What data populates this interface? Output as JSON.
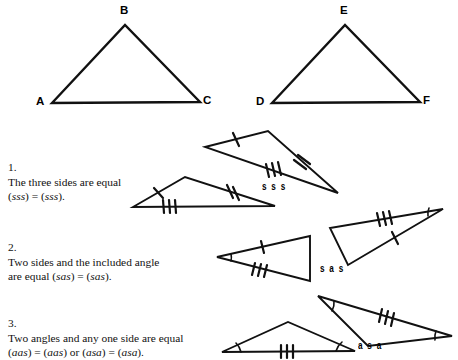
{
  "page": {
    "background_color": "#ffffff",
    "ink_color": "#111111",
    "width": 458,
    "height": 360
  },
  "reference_triangles": [
    {
      "name": "triangle-abc",
      "vertices": [
        {
          "label": "A",
          "x": 52,
          "y": 103,
          "label_x": 36,
          "label_y": 96
        },
        {
          "label": "B",
          "x": 125,
          "y": 25,
          "label_x": 120,
          "label_y": 5
        },
        {
          "label": "C",
          "x": 200,
          "y": 102,
          "label_x": 203,
          "label_y": 95
        }
      ]
    },
    {
      "name": "triangle-def",
      "vertices": [
        {
          "label": "D",
          "x": 272,
          "y": 103,
          "label_x": 256,
          "label_y": 96
        },
        {
          "label": "E",
          "x": 345,
          "y": 25,
          "label_x": 340,
          "label_y": 5
        },
        {
          "label": "F",
          "x": 420,
          "y": 102,
          "label_x": 423,
          "label_y": 95
        }
      ]
    }
  ],
  "rules": [
    {
      "id": "rule-sss",
      "number": "1.",
      "line1": "The three sides are equal",
      "line2_prefix": "(",
      "line2_sym1": "sss",
      "line2_mid": ") = (",
      "line2_sym2": "sss",
      "line2_suffix": ").",
      "criterion_label": "s s s",
      "criterion_label_x": 262,
      "criterion_label_y": 180,
      "text_x": 8,
      "text_y": 160
    },
    {
      "id": "rule-sas",
      "number": "2.",
      "line1": "Two sides and the included angle",
      "line2_prefix": "are equal (",
      "line2_sym1": "sas",
      "line2_mid": ") = (",
      "line2_sym2": "sas",
      "line2_suffix": ").",
      "criterion_label": "s a s",
      "criterion_label_x": 320,
      "criterion_label_y": 262,
      "text_x": 8,
      "text_y": 240
    },
    {
      "id": "rule-asa",
      "number": "3.",
      "line1": "Two angles and any one side are equal",
      "line2_prefix": "(",
      "line2_sym1": "aas",
      "line2_mid": ") = (",
      "line2_sym2": "aas",
      "line2_mid2": ") or (",
      "line2_sym3": "asa",
      "line2_mid3": ") = (",
      "line2_sym4": "asa",
      "line2_suffix": ").",
      "criterion_label": "a s a",
      "criterion_label_x": 358,
      "criterion_label_y": 339,
      "text_x": 8,
      "text_y": 316
    }
  ],
  "figure_groups": [
    {
      "id": "sss-pair",
      "triangles": [
        {
          "name": "sss-upper-triangle",
          "points": "205,147 268,131 338,193",
          "marks": [
            {
              "type": "ticks",
              "count": 1,
              "edge_from": [
                205,
                147
              ],
              "edge_to": [
                268,
                131
              ]
            },
            {
              "type": "ticks",
              "count": 2,
              "edge_from": [
                268,
                131
              ],
              "edge_to": [
                338,
                193
              ]
            },
            {
              "type": "ticks",
              "count": 3,
              "edge_from": [
                338,
                193
              ],
              "edge_to": [
                205,
                147
              ]
            }
          ]
        },
        {
          "name": "sss-lower-triangle",
          "points": "133,207 185,177 275,206",
          "marks": [
            {
              "type": "ticks",
              "count": 1,
              "edge_from": [
                133,
                207
              ],
              "edge_to": [
                185,
                177
              ]
            },
            {
              "type": "ticks",
              "count": 2,
              "edge_from": [
                185,
                177
              ],
              "edge_to": [
                275,
                206
              ]
            },
            {
              "type": "ticks",
              "count": 3,
              "edge_from": [
                275,
                206
              ],
              "edge_to": [
                133,
                207
              ]
            }
          ]
        }
      ]
    },
    {
      "id": "sas-pair",
      "triangles": [
        {
          "name": "sas-left-triangle",
          "points": "217,257 310,236 310,281",
          "marks": [
            {
              "type": "ticks",
              "count": 1,
              "edge_from": [
                217,
                257
              ],
              "edge_to": [
                310,
                236
              ]
            },
            {
              "type": "ticks",
              "count": 3,
              "edge_from": [
                310,
                281
              ],
              "edge_to": [
                217,
                257
              ]
            },
            {
              "type": "angle-arc",
              "vertex": [
                217,
                257
              ]
            }
          ]
        },
        {
          "name": "sas-right-triangle",
          "points": "443,209 330,228 348,265",
          "marks": [
            {
              "type": "ticks",
              "count": 3,
              "edge_from": [
                330,
                228
              ],
              "edge_to": [
                443,
                209
              ]
            },
            {
              "type": "ticks",
              "count": 1,
              "edge_from": [
                348,
                265
              ],
              "edge_to": [
                443,
                209
              ]
            },
            {
              "type": "angle-arc",
              "vertex": [
                443,
                209
              ]
            }
          ]
        }
      ]
    },
    {
      "id": "asa-pair",
      "triangles": [
        {
          "name": "asa-lower-triangle",
          "points": "222,352 288,322 355,351",
          "marks": [
            {
              "type": "ticks",
              "count": 3,
              "edge_from": [
                222,
                352
              ],
              "edge_to": [
                355,
                351
              ]
            },
            {
              "type": "angle-arc",
              "vertex": [
                222,
                352
              ]
            },
            {
              "type": "angle-arc",
              "vertex": [
                355,
                351
              ]
            }
          ]
        },
        {
          "name": "asa-upper-triangle",
          "points": "318,296 452,336 368,346",
          "marks": [
            {
              "type": "ticks",
              "count": 3,
              "edge_from": [
                318,
                296
              ],
              "edge_to": [
                452,
                336
              ]
            },
            {
              "type": "angle-arc",
              "vertex": [
                318,
                296
              ]
            },
            {
              "type": "angle-arc",
              "vertex": [
                452,
                336
              ]
            }
          ]
        }
      ]
    }
  ]
}
